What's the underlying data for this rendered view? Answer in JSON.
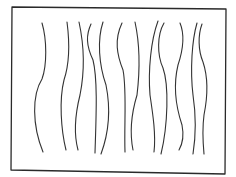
{
  "drawing": {
    "title": "Hand-drawn rectangle with wavy vertical lines",
    "style": "pencil sketch",
    "background_color": "#ffffff",
    "frame": {
      "stroke_color": "#2a2a2a",
      "path": "M12 7 L226 9 M226 9 L225 174 M225 174 L11 170 M11 170 L12 7"
    },
    "line_color": "#333333",
    "line_count": 13,
    "lines": [
      {
        "id": 1,
        "path": "M42 23 C47 40 47 65 42 79 C32 95 32 125 43 152"
      },
      {
        "id": 2,
        "path": "M67 22 C70 45 69 65 64 80 C59 100 61 130 66 150"
      },
      {
        "id": 3,
        "path": "M79 22 C84 45 85 70 80 95 C75 115 74 135 78 150"
      },
      {
        "id": 4,
        "path": "M91 24 C86 35 86 45 93 60 C98 80 96 120 95 153"
      },
      {
        "id": 5,
        "path": "M103 22 C97 40 99 65 106 85 C111 110 108 135 101 154"
      },
      {
        "id": 6,
        "path": "M122 23 C114 40 117 55 123 70 C127 90 124 125 125 152"
      },
      {
        "id": 7,
        "path": "M135 22 C140 45 140 70 137 95 C131 115 130 135 133 150"
      },
      {
        "id": 8,
        "path": "M158 21 C151 40 148 70 150 95 C153 115 156 135 154 152"
      },
      {
        "id": 9,
        "path": "M164 23 C157 35 157 55 163 68 C169 85 168 125 161 154"
      },
      {
        "id": 10,
        "path": "M180 23 C185 35 183 50 178 65 C172 90 177 110 182 125 C184 135 183 143 179 150"
      },
      {
        "id": 11,
        "path": "M197 23 C192 40 190 70 193 95 C196 115 196 135 193 154"
      },
      {
        "id": 12,
        "path": "M202 24 C198 35 198 50 203 62 C209 80 207 100 204 115 C202 130 203 143 204 154"
      },
      {
        "id": 13,
        "path": "M194 30 C192 40 192 55 195 68"
      }
    ]
  }
}
